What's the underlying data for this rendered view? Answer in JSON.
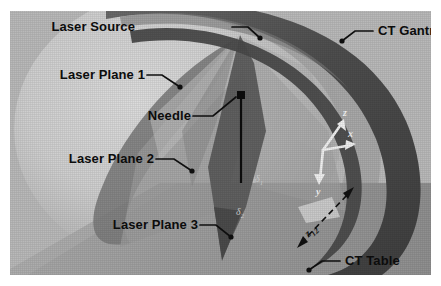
{
  "figure": {
    "kind": "technical-illustration",
    "background_color": "#b9b9b9",
    "border_color": "#ffffff"
  },
  "callouts": [
    {
      "id": "laser-source",
      "label": "Laser Source"
    },
    {
      "id": "ct-gantry",
      "label": "CT Gantry"
    },
    {
      "id": "laser-plane-1",
      "label": "Laser Plane 1"
    },
    {
      "id": "needle",
      "label": "Needle"
    },
    {
      "id": "laser-plane-2",
      "label": "Laser Plane 2"
    },
    {
      "id": "laser-plane-3",
      "label": "Laser Plane 3"
    },
    {
      "id": "ct-table",
      "label": "CT Table"
    }
  ],
  "axes": {
    "z_label": "z",
    "x_label": "x",
    "y_label": "y",
    "color": "#f2f2f2"
  },
  "annotations": {
    "delta1": "δ",
    "delta1_sub": "1",
    "delta2": "δ",
    "delta2_sub": "2",
    "z12": "z",
    "z12_sub": "12"
  },
  "colors": {
    "gantry_dark": "#5a5a5a",
    "gantry_face": "#c9c9c9",
    "bore_shadow": "#a3a3a3",
    "plane_mid": "#8f8f8f",
    "plane_dark": "#6e6e6e",
    "plane_light": "#b0b0b0",
    "table": "#9a9a9a",
    "needle": "#0d0d0d",
    "leader": "#101010"
  }
}
